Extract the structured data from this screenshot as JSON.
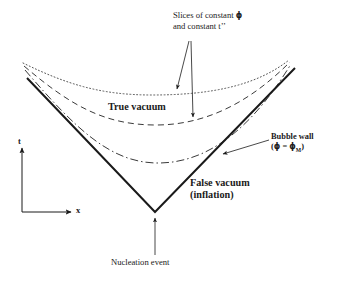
{
  "figure": {
    "title_present": false,
    "background_color": "#ffffff",
    "ink_color": "#1a1a1a"
  },
  "axes": {
    "t_label": "t",
    "x_label": "x",
    "origin": {
      "x": 22,
      "y": 212
    },
    "t_arrow_tip": {
      "x": 22,
      "y": 146
    },
    "x_arrow_tip": {
      "x": 73,
      "y": 212
    }
  },
  "labels": {
    "slices": {
      "line1_prefix": "Slices of constant ",
      "line1_symbol": "ϕ",
      "line2_prefix": "and constant t",
      "line2_suffix": "’’"
    },
    "true_vacuum": "True vacuum",
    "false_vacuum_line1": "False vacuum",
    "false_vacuum_line2": "(inflation)",
    "bubble_wall_line1": "Bubble wall",
    "bubble_wall_line2_open": "(",
    "bubble_wall_line2_phi": "ϕ",
    "bubble_wall_line2_eq": " = ",
    "bubble_wall_line2_phi2": "ϕ",
    "bubble_wall_line2_sub": "M",
    "bubble_wall_line2_close": ")",
    "nucleation_event": "Nucleation event"
  },
  "curves": [
    {
      "name": "light-cone-bubble-wall",
      "style": "solid",
      "stroke_width": 2.0,
      "color": "#1a1a1a",
      "description": "Bold V shaped light cone / bubble wall",
      "path": "M 27 78 L 155 212 L 295 68"
    },
    {
      "name": "slice-constant-phi-inner",
      "style": "dash-dot",
      "stroke_width": 1.0,
      "color": "#3a3a3a",
      "description": "Innermost hyperbolic slice of constant phi",
      "path": "M 25 70 C 75 128, 110 163, 158 163 C 215 163, 258 118, 291 64"
    },
    {
      "name": "slice-constant-phi-middle",
      "style": "dashed",
      "stroke_width": 1.0,
      "color": "#3a3a3a",
      "description": "Middle hyperbolic slice of constant phi",
      "path": "M 24 66 C 70 105, 104 125, 156 125 C 212 125, 256 96, 290 62"
    },
    {
      "name": "slice-constant-phi-outer",
      "style": "dotted",
      "stroke_width": 1.0,
      "color": "#555555",
      "description": "Outermost hyperbolic slice of constant phi",
      "path": "M 23 63 C 68 85, 102 95, 152 95 C 210 95, 256 86, 289 60"
    }
  ],
  "leaders": [
    {
      "name": "slices-leader-to-dotted",
      "from": {
        "x": 189,
        "y": 41
      },
      "to": {
        "x": 176,
        "y": 91
      },
      "arrow": true
    },
    {
      "name": "slices-leader-to-dashed",
      "from": {
        "x": 191,
        "y": 41
      },
      "to": {
        "x": 193,
        "y": 119
      },
      "arrow": true
    },
    {
      "name": "bubble-wall-leader",
      "from": {
        "x": 269,
        "y": 140
      },
      "to": {
        "x": 221,
        "y": 155
      },
      "arrow": true
    },
    {
      "name": "nucleation-leader",
      "from": {
        "x": 155,
        "y": 255
      },
      "to": {
        "x": 155,
        "y": 216
      },
      "arrow": true
    }
  ]
}
